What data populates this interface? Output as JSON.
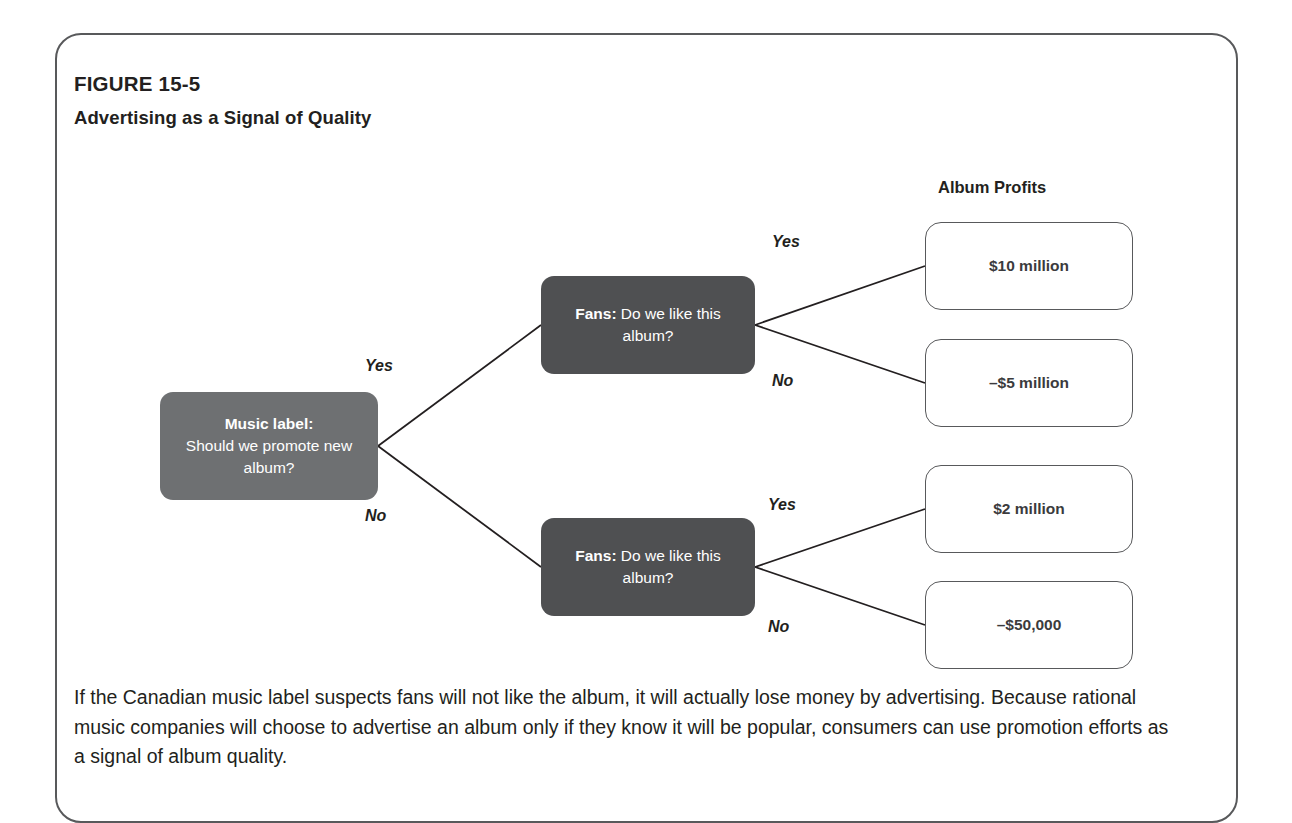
{
  "figure": {
    "number": "FIGURE 15-5",
    "title": "Advertising as a Signal of Quality"
  },
  "diagram": {
    "profits_heading": "Album Profits",
    "nodes": {
      "root": {
        "lead": "Music label:",
        "question": "Should we promote new album?"
      },
      "fans_top": {
        "lead": "Fans:",
        "question": "Do we like this album?"
      },
      "fans_bottom": {
        "lead": "Fans:",
        "question": "Do we like this album?"
      }
    },
    "branch_labels": {
      "root_yes": "Yes",
      "root_no": "No",
      "top_yes": "Yes",
      "top_no": "No",
      "bottom_yes": "Yes",
      "bottom_no": "No"
    },
    "outcomes": [
      {
        "value": "$10 million"
      },
      {
        "value": "–$5 million"
      },
      {
        "value": "$2 million"
      },
      {
        "value": "–$50,000"
      }
    ],
    "colors": {
      "root_node_fill": "#6e7072",
      "decision_node_fill": "#4f5052",
      "outcome_border": "#58595b",
      "line": "#231f20",
      "panel_border": "#58595b"
    }
  },
  "caption": {
    "text": "If the Canadian music label suspects fans will not like the album, it will actually lose money by advertising. Because rational music companies will choose to advertise an album only if they know it will be popular, consumers can use promotion efforts as a signal of album quality."
  }
}
